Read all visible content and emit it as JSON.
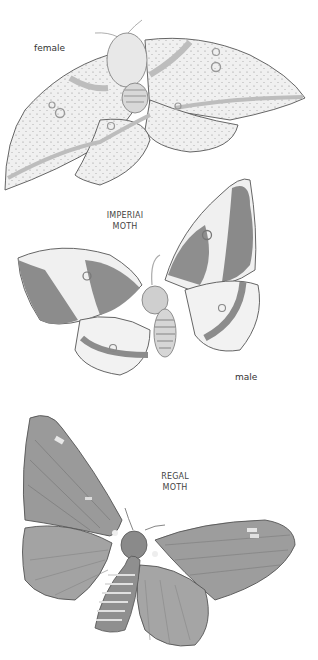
{
  "illustrations": [
    {
      "name": "imperial-moth-female",
      "caption": "female"
    },
    {
      "name": "imperial-moth-male",
      "title_line1": "IMPERIAI",
      "title_line2": "MOTH",
      "caption": "male"
    },
    {
      "name": "regal-moth",
      "title_line1": "REGAL",
      "title_line2": "MOTH"
    }
  ],
  "colors": {
    "paper": "#ffffff",
    "outline": "#555555",
    "wash_light": "#e6e6e6",
    "wash_mid": "#a8a8a8",
    "wash_dark": "#7a7a7a"
  }
}
